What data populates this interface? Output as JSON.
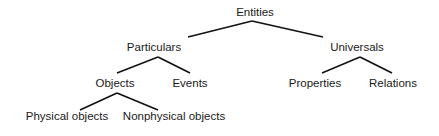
{
  "diagram": {
    "type": "tree",
    "edge_color": "#111111",
    "nodes": [
      {
        "id": "entities",
        "label": "Entities",
        "x": 255,
        "y": 12
      },
      {
        "id": "particulars",
        "label": "Particulars",
        "x": 154,
        "y": 47
      },
      {
        "id": "universals",
        "label": "Universals",
        "x": 357,
        "y": 47
      },
      {
        "id": "objects",
        "label": "Objects",
        "x": 115,
        "y": 83
      },
      {
        "id": "events",
        "label": "Events",
        "x": 190,
        "y": 83
      },
      {
        "id": "properties",
        "label": "Properties",
        "x": 315,
        "y": 83
      },
      {
        "id": "relations",
        "label": "Relations",
        "x": 393,
        "y": 83
      },
      {
        "id": "physical",
        "label": "Physical objects",
        "x": 67,
        "y": 116
      },
      {
        "id": "nonphysical",
        "label": "Nonphysical objects",
        "x": 174,
        "y": 116
      }
    ],
    "edges": [
      {
        "from": "entities",
        "to": "particulars"
      },
      {
        "from": "entities",
        "to": "universals"
      },
      {
        "from": "particulars",
        "to": "objects"
      },
      {
        "from": "particulars",
        "to": "events"
      },
      {
        "from": "universals",
        "to": "properties"
      },
      {
        "from": "universals",
        "to": "relations"
      },
      {
        "from": "objects",
        "to": "physical"
      },
      {
        "from": "objects",
        "to": "nonphysical"
      }
    ]
  }
}
